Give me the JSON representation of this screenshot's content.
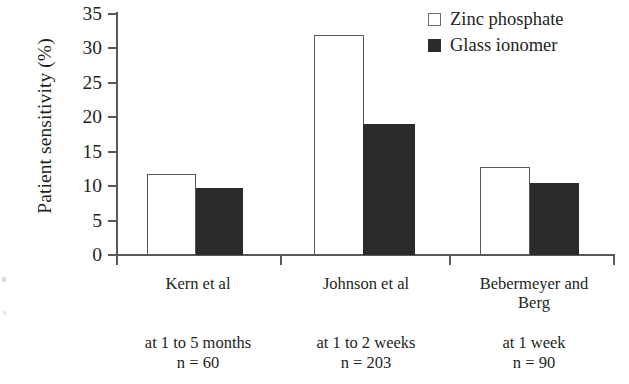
{
  "chart_data": {
    "type": "bar",
    "title": "",
    "xlabel": "",
    "ylabel": "Patient sensitivity (%)",
    "ylim": [
      0,
      35
    ],
    "yticks": [
      0,
      5,
      10,
      15,
      20,
      25,
      30,
      35
    ],
    "ytick_labels": [
      "0",
      "5",
      "10",
      "15",
      "20",
      "25",
      "30",
      "35"
    ],
    "grid": false,
    "legend_position": "top-right",
    "categories": [
      "Kern et al",
      "Johnson et al",
      "Bebermeyer and Berg"
    ],
    "category_sublabels": [
      {
        "line1": "at 1 to 5 months",
        "line2": "n = 60"
      },
      {
        "line1": "at 1 to 2 weeks",
        "line2": "n = 203"
      },
      {
        "line1": "at 1 week",
        "line2": "n = 90"
      }
    ],
    "series": [
      {
        "name": "Zinc phosphate",
        "color": "#ffffff",
        "edge_color": "#58595b",
        "values": [
          11.8,
          32.0,
          12.8
        ]
      },
      {
        "name": "Glass ionomer",
        "color": "#2b2b2b",
        "edge_color": "#2b2b2b",
        "values": [
          9.8,
          19.0,
          10.5
        ]
      }
    ]
  },
  "axis": {
    "y_title": "Patient sensitivity (%)",
    "ticks": [
      {
        "value": "35"
      },
      {
        "value": "30"
      },
      {
        "value": "25"
      },
      {
        "value": "20"
      },
      {
        "value": "15"
      },
      {
        "value": "10"
      },
      {
        "value": "5"
      },
      {
        "value": "0"
      }
    ]
  },
  "legend": {
    "items": [
      {
        "label": "Zinc phosphate",
        "marker": "open-square"
      },
      {
        "label": "Glass ionomer",
        "marker": "filled-square"
      }
    ]
  },
  "groups": [
    {
      "label": "Kern et al",
      "label_line2": "",
      "sub_line1": "at 1 to 5 months",
      "sub_line2": "n = 60",
      "zinc_value": "11.8",
      "glass_value": "9.8"
    },
    {
      "label": "Johnson et al",
      "label_line2": "",
      "sub_line1": "at 1 to 2 weeks",
      "sub_line2": "n = 203",
      "zinc_value": "32.0",
      "glass_value": "19.0"
    },
    {
      "label": "Bebermeyer and",
      "label_line2": "Berg",
      "sub_line1": "at 1 week",
      "sub_line2": "n = 90",
      "zinc_value": "12.8",
      "glass_value": "10.5"
    }
  ]
}
